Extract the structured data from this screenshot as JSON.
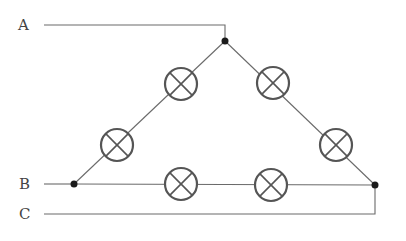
{
  "diagram": {
    "type": "circuit",
    "colors": {
      "wire": "#6a6a6a",
      "lamp": "#555555",
      "node": "#1a1a1a",
      "label": "#444444"
    },
    "lines": [
      {
        "label": "A",
        "label_x": 18,
        "label_y": 30,
        "x1": 44,
        "y1": 25,
        "x2": 225,
        "y2": 25
      },
      {
        "label": "B",
        "label_x": 19,
        "label_y": 189,
        "x1": 44,
        "y1": 184,
        "x2": 74,
        "y2": 184
      },
      {
        "label": "C",
        "label_x": 19,
        "label_y": 219,
        "x1": 44,
        "y1": 214,
        "x2": 375,
        "y2": 214
      }
    ],
    "nodes": [
      {
        "name": "top-node",
        "cx": 225,
        "cy": 41
      },
      {
        "name": "left-node",
        "cx": 74,
        "cy": 184
      },
      {
        "name": "right-node",
        "cx": 375,
        "cy": 185
      }
    ],
    "lamps": [
      {
        "side": "A-B",
        "cx": 181,
        "cy": 84
      },
      {
        "side": "A-B",
        "cx": 117,
        "cy": 145
      },
      {
        "side": "A-C",
        "cx": 273,
        "cy": 83
      },
      {
        "side": "A-C",
        "cx": 336,
        "cy": 145
      },
      {
        "side": "B-C",
        "cx": 181,
        "cy": 184
      },
      {
        "side": "B-C",
        "cx": 271,
        "cy": 185
      }
    ],
    "lamp_radius": 16
  }
}
